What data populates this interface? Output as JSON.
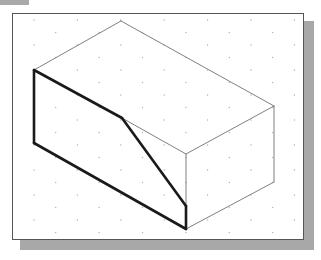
{
  "figure": {
    "type": "isometric-drawing",
    "grid": {
      "style": "isometric-dots",
      "dx": 21.7,
      "dy": 12.5,
      "color": "#b0b0b0"
    },
    "colors": {
      "thin_line": "#808080",
      "thick_line": "#1a1a1a",
      "frame_border": "#555555",
      "shadow": "#a8a8a8",
      "tab": "#a9a9a9"
    },
    "vertices": {
      "top": [
        121,
        21
      ],
      "left_top": [
        34,
        70
      ],
      "left_bottom": [
        34,
        143
      ],
      "center_top": [
        186,
        154
      ],
      "center_bottom": [
        186,
        229
      ],
      "right_top": [
        274,
        106
      ],
      "right_bottom": [
        274,
        182
      ],
      "bend": [
        122,
        118
      ],
      "slope_end": [
        186,
        206
      ]
    },
    "thin_edges": [
      [
        [
          34,
          70
        ],
        [
          121,
          21
        ]
      ],
      [
        [
          121,
          21
        ],
        [
          274,
          106
        ]
      ],
      [
        [
          274,
          106
        ],
        [
          186,
          154
        ]
      ],
      [
        [
          186,
          154
        ],
        [
          122,
          118
        ]
      ],
      [
        [
          274,
          106
        ],
        [
          274,
          182
        ]
      ],
      [
        [
          274,
          182
        ],
        [
          186,
          229
        ]
      ],
      [
        [
          186,
          154
        ],
        [
          186,
          206
        ]
      ]
    ],
    "thick_edges": [
      [
        [
          34,
          70
        ],
        [
          34,
          143
        ]
      ],
      [
        [
          34,
          143
        ],
        [
          186,
          229
        ]
      ],
      [
        [
          186,
          229
        ],
        [
          186,
          206
        ]
      ],
      [
        [
          186,
          206
        ],
        [
          122,
          118
        ]
      ],
      [
        [
          122,
          118
        ],
        [
          34,
          70
        ]
      ]
    ]
  }
}
